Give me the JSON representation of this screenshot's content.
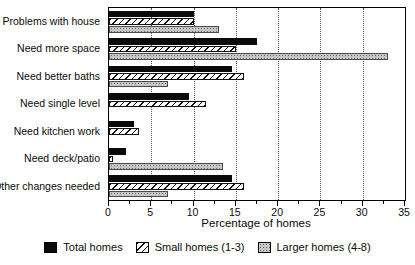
{
  "chart_data": {
    "type": "bar",
    "orientation": "horizontal",
    "title": "",
    "xlabel": "Percentage of homes",
    "xlim": [
      0,
      35
    ],
    "xticks": [
      0,
      5,
      10,
      15,
      20,
      25,
      30,
      35
    ],
    "xticks_minor": [
      2.5,
      7.5,
      12.5,
      17.5,
      22.5,
      27.5,
      32.5
    ],
    "gridlines": [
      5,
      10,
      15,
      20,
      25,
      30
    ],
    "grid": "dotted-vertical",
    "legend_position": "bottom",
    "categories": [
      "Problems with house",
      "Need more space",
      "Need better baths",
      "Need single level",
      "Need kitchen work",
      "Need deck/patio",
      "Other changes needed"
    ],
    "series": [
      {
        "name": "Total homes",
        "pattern": "solid",
        "color": "#0a0a0a",
        "values": [
          10,
          17.5,
          14.5,
          9.5,
          3,
          2,
          14.5
        ]
      },
      {
        "name": "Small homes (1-3)",
        "pattern": "hatch",
        "color": "#ffffff",
        "hatch_color": "#111111",
        "values": [
          10,
          15,
          16,
          11.5,
          3.5,
          0.5,
          16
        ]
      },
      {
        "name": "Larger homes (4-8)",
        "pattern": "stipple",
        "color": "#c6c6c6",
        "dot_color": "#6a6a6a",
        "values": [
          13,
          33,
          7,
          0,
          0,
          13.5,
          7
        ]
      }
    ]
  }
}
